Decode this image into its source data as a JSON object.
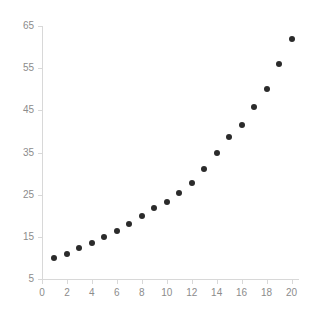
{
  "chart_data": {
    "type": "scatter",
    "title": "",
    "subtitle": "",
    "xlabel": "",
    "ylabel": "",
    "grid": false,
    "legend": false,
    "legend_position": "none",
    "point_color": "#2b2b2b",
    "axis_color": "#d8d8d8",
    "tick_label_color": "#8c8c8c",
    "background_color": "#ffffff",
    "xlim": [
      0,
      20.6
    ],
    "ylim": [
      5,
      65
    ],
    "xticks": [
      0,
      2,
      4,
      6,
      8,
      10,
      12,
      14,
      16,
      18,
      20
    ],
    "xticklabels": [
      "0",
      "2",
      "4",
      "6",
      "8",
      "10",
      "12",
      "14",
      "16",
      "18",
      "20"
    ],
    "yticks": [
      5,
      15,
      25,
      35,
      45,
      55,
      65
    ],
    "yticklabels": [
      "5",
      "15",
      "25",
      "35",
      "45",
      "55",
      "65"
    ],
    "x": [
      1,
      2,
      3,
      4,
      5,
      6,
      7,
      8,
      9,
      10,
      11,
      12,
      13,
      14,
      15,
      16,
      17,
      18,
      19,
      20
    ],
    "y": [
      10.0,
      11.0,
      12.3,
      13.5,
      15.0,
      16.5,
      18.0,
      20.0,
      21.8,
      23.3,
      25.5,
      27.8,
      31.2,
      34.8,
      38.6,
      41.5,
      45.7,
      50.0,
      56.0,
      62.0
    ],
    "points": [
      {
        "x": 1,
        "y": 10.0
      },
      {
        "x": 2,
        "y": 11.0
      },
      {
        "x": 3,
        "y": 12.3
      },
      {
        "x": 4,
        "y": 13.5
      },
      {
        "x": 5,
        "y": 15.0
      },
      {
        "x": 6,
        "y": 16.5
      },
      {
        "x": 7,
        "y": 18.0
      },
      {
        "x": 8,
        "y": 20.0
      },
      {
        "x": 9,
        "y": 21.8
      },
      {
        "x": 10,
        "y": 23.3
      },
      {
        "x": 11,
        "y": 25.5
      },
      {
        "x": 12,
        "y": 27.8
      },
      {
        "x": 13,
        "y": 31.2
      },
      {
        "x": 14,
        "y": 34.8
      },
      {
        "x": 15,
        "y": 38.6
      },
      {
        "x": 16,
        "y": 41.5
      },
      {
        "x": 17,
        "y": 45.7
      },
      {
        "x": 18,
        "y": 50.0
      },
      {
        "x": 19,
        "y": 56.0
      },
      {
        "x": 20,
        "y": 62.0
      }
    ]
  }
}
